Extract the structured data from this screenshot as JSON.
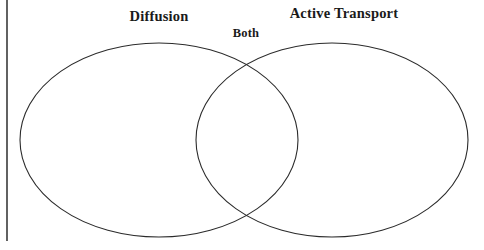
{
  "diagram": {
    "type": "venn-2-set",
    "background_color": "#ffffff",
    "stroke_color": "#2b2b2b",
    "stroke_width": 1,
    "text_color": "#1a1a1a",
    "labels": {
      "left_set": "Diffusion",
      "right_set": "Active Transport",
      "intersection": "Both"
    },
    "shapes": {
      "left_ellipse": {
        "cx": 159,
        "cy": 140,
        "rx": 139,
        "ry": 97
      },
      "right_ellipse": {
        "cx": 332,
        "cy": 140,
        "rx": 136,
        "ry": 97
      }
    },
    "page_border": {
      "orientation": "vertical",
      "x": 7,
      "y_start": 0,
      "y_end": 241,
      "color": "#3a3a3a"
    },
    "regions": {
      "left_only_items": [],
      "right_only_items": [],
      "intersection_items": []
    }
  }
}
